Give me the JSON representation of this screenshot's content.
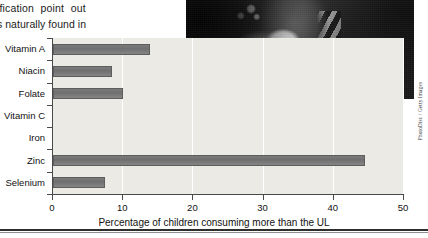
{
  "bodycopy": {
    "line1": "tification  point  out",
    "line2": "ts naturally found in"
  },
  "photo": {
    "alt_name": "child-eating-cereal-photo",
    "credit": "PhotoDisc / Getty Images"
  },
  "chart_data": {
    "type": "bar",
    "orientation": "horizontal",
    "title": "",
    "xlabel": "Percentage of children consuming more than the UL",
    "ylabel": "",
    "categories": [
      "Vitamin A",
      "Niacin",
      "Folate",
      "Vitamin C",
      "Iron",
      "Zinc",
      "Selenium"
    ],
    "values": [
      13.8,
      8.4,
      10.0,
      0,
      0,
      44.5,
      7.4
    ],
    "xlim": [
      0,
      50
    ],
    "xticks": [
      0,
      10,
      20,
      30,
      40,
      50
    ],
    "xtick_labels": [
      "0",
      "10",
      "20",
      "30",
      "40",
      "50"
    ],
    "grid": "vertical",
    "legend": "none",
    "bar_color": "#757575",
    "plot_background": "#eceae4"
  }
}
